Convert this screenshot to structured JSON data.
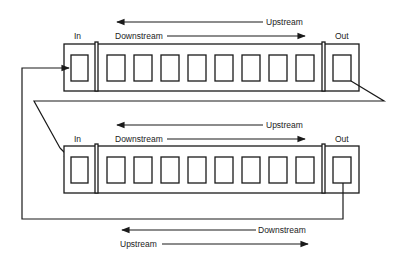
{
  "diagram": {
    "colors": {
      "stroke": "#1a1a1a",
      "text": "#222222",
      "background": "#ffffff"
    },
    "top_module": {
      "labels": {
        "in": "In",
        "out": "Out",
        "upstream": "Upstream",
        "downstream": "Downstream"
      },
      "slot_count": 8
    },
    "bottom_module": {
      "labels": {
        "in": "In",
        "out": "Out",
        "upstream": "Upstream",
        "downstream": "Downstream"
      },
      "slot_count": 8
    },
    "bottom_ring": {
      "labels": {
        "downstream": "Downstream",
        "upstream": "Upstream"
      }
    }
  }
}
